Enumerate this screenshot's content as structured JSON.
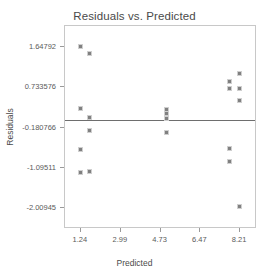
{
  "chart_data": {
    "type": "scatter",
    "title": "Residuals vs. Predicted",
    "xlabel": "Predicted",
    "ylabel": "Residuals",
    "grid": false,
    "legend": null,
    "xticks": [
      "1.24",
      "2.99",
      "4.73",
      "6.47",
      "8.21"
    ],
    "xtick_values": [
      1.24,
      2.99,
      4.73,
      6.47,
      8.21
    ],
    "yticks": [
      "1.64792",
      "0.733576",
      "-0.180766",
      "-1.09511",
      "-2.00945"
    ],
    "ytick_values": [
      1.64792,
      0.733576,
      -0.180766,
      -1.09511,
      -2.00945
    ],
    "xlim": [
      0.55,
      8.95
    ],
    "ylim": [
      -2.48,
      2.12
    ],
    "reference_line": {
      "orientation": "horizontal",
      "y": 0.0
    },
    "marker": {
      "shape": "square",
      "color": "#808080",
      "edge_color": "#cfcfcf",
      "size": 5
    },
    "points": [
      {
        "x": 1.24,
        "y": 1.64792
      },
      {
        "x": 1.66,
        "y": 1.49
      },
      {
        "x": 1.24,
        "y": 0.24
      },
      {
        "x": 1.66,
        "y": 0.03
      },
      {
        "x": 1.24,
        "y": -0.69
      },
      {
        "x": 1.66,
        "y": -0.27
      },
      {
        "x": 1.24,
        "y": -1.21
      },
      {
        "x": 1.66,
        "y": -1.18
      },
      {
        "x": 5.03,
        "y": 0.22
      },
      {
        "x": 5.03,
        "y": 0.12
      },
      {
        "x": 5.03,
        "y": 0.02
      },
      {
        "x": 5.03,
        "y": -0.31
      },
      {
        "x": 7.79,
        "y": 0.85
      },
      {
        "x": 7.79,
        "y": 0.7
      },
      {
        "x": 7.79,
        "y": -0.66
      },
      {
        "x": 7.79,
        "y": -0.96
      },
      {
        "x": 8.21,
        "y": 1.03
      },
      {
        "x": 8.21,
        "y": 0.7
      },
      {
        "x": 8.21,
        "y": 0.41
      },
      {
        "x": 8.21,
        "y": -1.99
      }
    ]
  }
}
